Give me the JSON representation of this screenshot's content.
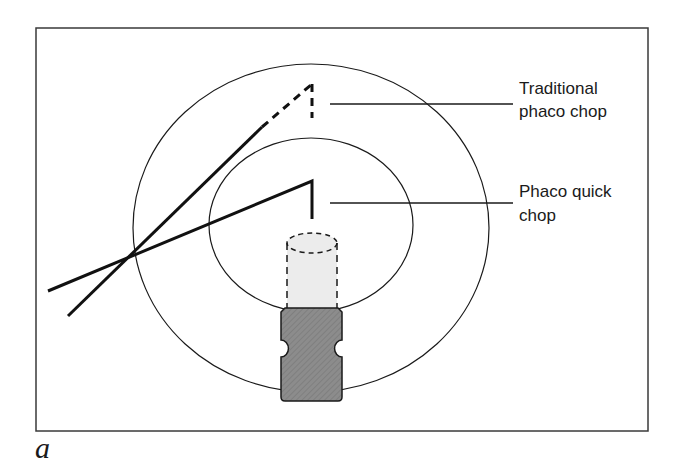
{
  "figure": {
    "panel_label": "a",
    "labels": {
      "traditional": {
        "line1": "Traditional",
        "line2": "phaco chop"
      },
      "quick": {
        "line1": "Phaco quick",
        "line2": "chop"
      }
    },
    "colors": {
      "stroke": "#1a1a1a",
      "frame": "#3a3a3a",
      "handle_fill": "#8c8c8c",
      "tip_fill": "#ececec"
    },
    "elements": {
      "outer_circle": "outer-ellipse (nucleus)",
      "inner_circle": "inner-ellipse (endonucleus)",
      "phaco_tip": "dashed cylinder (phaco tip, hidden)",
      "phaco_handle": "grey handpiece",
      "traditional_chopper": "chopper path to periphery (dashed end)",
      "quick_chopper": "chopper path to center (solid)"
    }
  }
}
